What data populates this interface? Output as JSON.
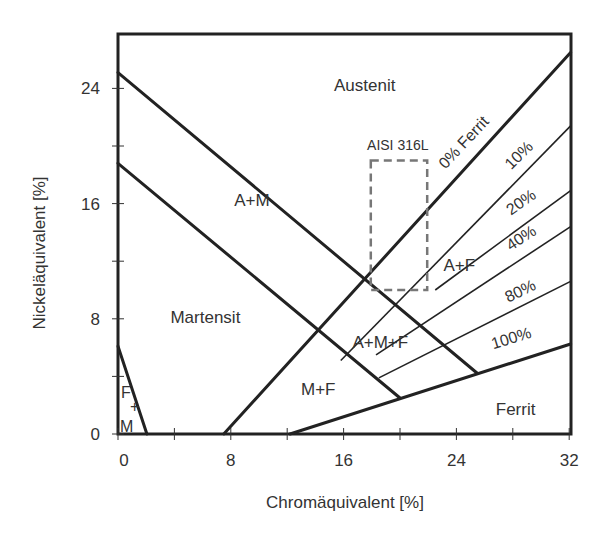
{
  "chart_data": {
    "type": "diagram",
    "xlabel": "Chromäquivalent [%]",
    "ylabel": "Nickeläquivalent [%]",
    "xlim": [
      0,
      32
    ],
    "ylim": [
      0,
      28
    ],
    "x_ticks": [
      {
        "v": 0,
        "label": "0"
      },
      {
        "v": 4,
        "label": ""
      },
      {
        "v": 8,
        "label": "8"
      },
      {
        "v": 12,
        "label": ""
      },
      {
        "v": 16,
        "label": "16"
      },
      {
        "v": 20,
        "label": ""
      },
      {
        "v": 24,
        "label": "24"
      },
      {
        "v": 28,
        "label": ""
      },
      {
        "v": 32,
        "label": "32"
      }
    ],
    "y_ticks": [
      {
        "v": 0,
        "label": "0"
      },
      {
        "v": 4,
        "label": ""
      },
      {
        "v": 8,
        "label": "8"
      },
      {
        "v": 12,
        "label": ""
      },
      {
        "v": 16,
        "label": "16"
      },
      {
        "v": 20,
        "label": ""
      },
      {
        "v": 24,
        "label": "24"
      }
    ],
    "boundaries": [
      {
        "name": "austenite-martensite-upper",
        "points": [
          [
            0,
            25.1
          ],
          [
            25.5,
            4.2
          ]
        ],
        "width": 3
      },
      {
        "name": "martensite-upper",
        "points": [
          [
            0,
            18.8
          ],
          [
            20,
            2.5
          ]
        ],
        "width": 3
      },
      {
        "name": "ferrite-0",
        "points": [
          [
            7.5,
            0
          ],
          [
            32.1,
            26.5
          ]
        ],
        "width": 3
      },
      {
        "name": "ferrite-100",
        "points": [
          [
            12.2,
            0
          ],
          [
            32.1,
            6.25
          ]
        ],
        "width": 3
      },
      {
        "name": "ferrite-martensite-triangle",
        "points": [
          [
            0,
            6.1
          ],
          [
            2.05,
            0
          ]
        ],
        "width": 3
      }
    ],
    "ferrite_lines": [
      {
        "label": "10%",
        "points": [
          [
            15.8,
            5.1
          ],
          [
            32.1,
            21.4
          ]
        ]
      },
      {
        "label": "20%",
        "points": [
          [
            22.5,
            10.0
          ],
          [
            32.1,
            16.9
          ]
        ]
      },
      {
        "label": "40%",
        "points": [
          [
            18.3,
            5.5
          ],
          [
            32.1,
            14.4
          ]
        ]
      },
      {
        "label": "80%",
        "points": [
          [
            18.5,
            3.9
          ],
          [
            32.1,
            10.6
          ]
        ]
      }
    ],
    "regions": [
      {
        "label": "Austenit",
        "x": 17.5,
        "y": 23.8
      },
      {
        "label": "A+M",
        "x": 9.5,
        "y": 15.8
      },
      {
        "label": "Martensit",
        "x": 6.2,
        "y": 7.7
      },
      {
        "label": "M+F",
        "x": 14.2,
        "y": 2.7
      },
      {
        "label": "A+M+F",
        "x": 18.6,
        "y": 6.0
      },
      {
        "label": "A+F",
        "x": 24.2,
        "y": 11.3
      },
      {
        "label": "Ferrit",
        "x": 28.2,
        "y": 1.3
      }
    ],
    "fm_label": {
      "top": "F",
      "middle": "+",
      "bottom": "M"
    },
    "ferrite_labels": [
      {
        "text": "0% Ferrit",
        "x": 24.8,
        "y": 20.0,
        "angle": -47
      },
      {
        "text": "10%",
        "x": 28.7,
        "y": 19.1,
        "angle": -45
      },
      {
        "text": "20%",
        "x": 28.8,
        "y": 15.8,
        "angle": -35
      },
      {
        "text": "40%",
        "x": 28.8,
        "y": 13.3,
        "angle": -33
      },
      {
        "text": "80%",
        "x": 28.7,
        "y": 9.6,
        "angle": -26
      },
      {
        "text": "100%",
        "x": 28.0,
        "y": 6.3,
        "angle": -17
      }
    ],
    "annotation": {
      "label": "AISI 316L",
      "box": [
        18,
        10,
        22,
        19
      ]
    }
  }
}
